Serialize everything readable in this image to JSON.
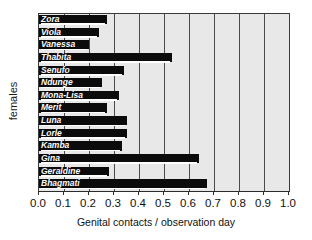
{
  "chart_data": {
    "type": "bar",
    "orientation": "horizontal",
    "title": "",
    "xlabel": "Genital contacts / observation day",
    "ylabel": "females",
    "xlim": [
      0.0,
      1.0
    ],
    "xticks": [
      "0.0",
      "0.1",
      "0.2",
      "0.3",
      "0.4",
      "0.5",
      "0.6",
      "0.7",
      "0.8",
      "0.9",
      "1.0"
    ],
    "grid": true,
    "legend": "none",
    "bar_color": "#0b0b0b",
    "plot_background": "#e8e8e8",
    "categories": [
      "Zora",
      "Viola",
      "Vanessa",
      "Thabita",
      "Senufo",
      "Ndunge",
      "Mona-Lisa",
      "Merit",
      "Luna",
      "Lorle",
      "Kamba",
      "Gina",
      "Geraldine",
      "Bhagmati"
    ],
    "values": [
      0.27,
      0.24,
      0.2,
      0.53,
      0.34,
      0.25,
      0.32,
      0.27,
      0.35,
      0.35,
      0.33,
      0.64,
      0.28,
      0.67
    ]
  }
}
